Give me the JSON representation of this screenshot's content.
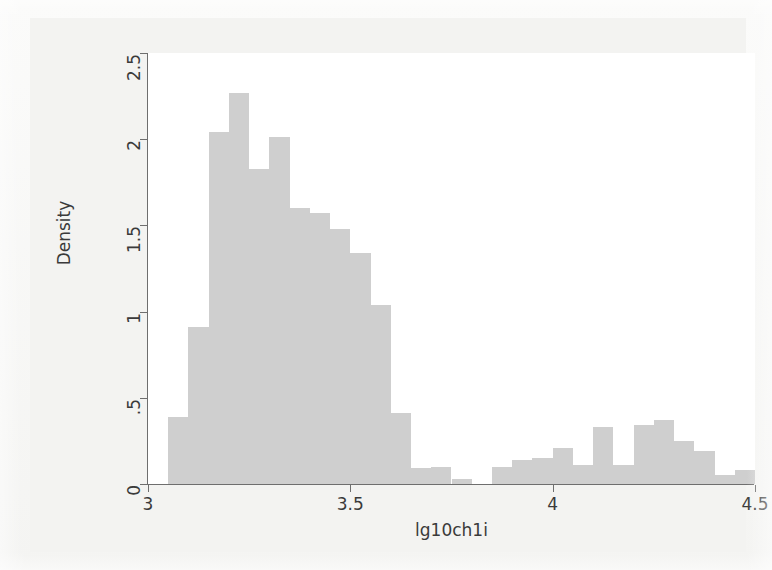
{
  "chart_data": {
    "type": "bar",
    "subtype": "histogram",
    "title": "",
    "subtitle": "",
    "xlabel": "lg10ch1i",
    "ylabel": "Density",
    "xlim": [
      3.0,
      4.5
    ],
    "ylim": [
      0,
      2.5
    ],
    "xticks": [
      "3",
      "3.5",
      "4",
      "4.5"
    ],
    "xtick_values": [
      3,
      3.5,
      4,
      4.5
    ],
    "yticks": [
      "0",
      ".5",
      "1",
      "1.5",
      "2",
      "2.5"
    ],
    "ytick_values": [
      0,
      0.5,
      1,
      1.5,
      2,
      2.5
    ],
    "grid": false,
    "legend": false,
    "bar_color": "#cfcfcf",
    "axis_color": "#6e6e6e",
    "plot_background": "#ffffff",
    "figure_background": "#f3f3f1",
    "bin_width": 0.05,
    "bin_starts": [
      3.05,
      3.1,
      3.15,
      3.2,
      3.25,
      3.3,
      3.35,
      3.4,
      3.45,
      3.5,
      3.55,
      3.6,
      3.65,
      3.7,
      3.75,
      3.8,
      3.85,
      3.9,
      3.95,
      4.0,
      4.05,
      4.1,
      4.15,
      4.2,
      4.25,
      4.3,
      4.35,
      4.4,
      4.45
    ],
    "categories": [
      "3.05",
      "3.10",
      "3.15",
      "3.20",
      "3.25",
      "3.30",
      "3.35",
      "3.40",
      "3.45",
      "3.50",
      "3.55",
      "3.60",
      "3.65",
      "3.70",
      "3.75",
      "3.80",
      "3.85",
      "3.90",
      "3.95",
      "4.00",
      "4.05",
      "4.10",
      "4.15",
      "4.20",
      "4.25",
      "4.30",
      "4.35",
      "4.40",
      "4.45"
    ],
    "values": [
      0.39,
      0.91,
      2.04,
      2.27,
      1.83,
      2.01,
      1.6,
      1.57,
      1.48,
      1.34,
      1.04,
      0.41,
      0.09,
      0.1,
      0.03,
      0.0,
      0.1,
      0.14,
      0.15,
      0.21,
      0.11,
      0.33,
      0.11,
      0.34,
      0.37,
      0.25,
      0.19,
      0.05,
      0.08
    ]
  },
  "axes": {
    "x_title": "lg10ch1i",
    "y_title": "Density"
  }
}
